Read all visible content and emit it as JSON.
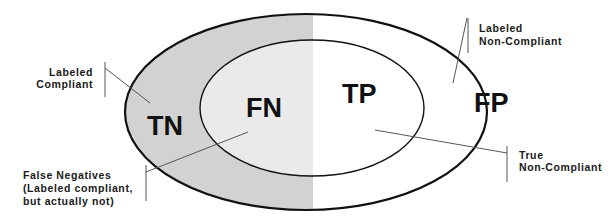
{
  "colors": {
    "outer_ring_left": "#d2d2d2",
    "inner_left": "#eaeaea",
    "right_half": "#ffffff",
    "outline": "#111111",
    "callout_line": "#555555"
  },
  "regions": {
    "tn": {
      "label": "TN"
    },
    "fn": {
      "label": "FN"
    },
    "tp": {
      "label": "TP"
    },
    "fp": {
      "label": "FP"
    }
  },
  "callouts": {
    "labeled_compliant": {
      "lines": [
        "Labeled",
        "Compliant"
      ]
    },
    "false_negatives": {
      "lines": [
        "False Negatives",
        "(Labeled compliant,",
        "but actually not)"
      ]
    },
    "labeled_non_compliant": {
      "lines": [
        "Labeled",
        "Non-Compliant"
      ]
    },
    "true_non_compliant": {
      "lines": [
        "True",
        "Non-Compliant"
      ]
    }
  }
}
